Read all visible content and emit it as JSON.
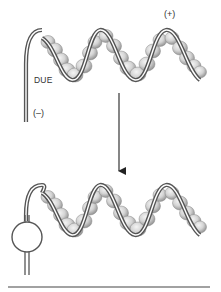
{
  "diagram": {
    "top_panel": {
      "name": "origin-before-unwinding",
      "labels": {
        "plus_end": "(+)",
        "due": "DUE",
        "minus_end": "(–)"
      }
    },
    "transition": {
      "arrow": "down"
    },
    "bottom_panel": {
      "name": "origin-with-open-bubble",
      "features": [
        "melted DUE bubble",
        "helical DNA wrapped around protein filament"
      ]
    },
    "colors": {
      "strand": "#555555",
      "strand_gap": "#ffffff",
      "bead_fill": "#d9d9d9",
      "bead_shadow": "#9a9a9a",
      "bead_highlight": "#f4f4f4",
      "arrow": "#222222",
      "rule": "#444444"
    }
  }
}
